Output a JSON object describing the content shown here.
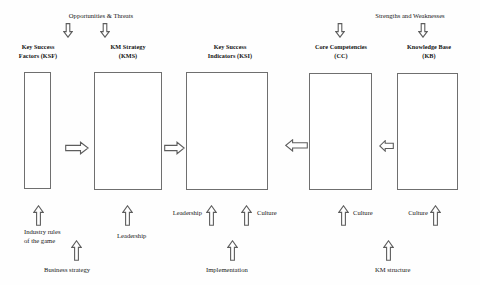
{
  "diagram": {
    "title_top_left": "Opportunities & Threats",
    "title_top_right": "Strengths and Weaknesses",
    "boxes": [
      {
        "id": "ksf",
        "line1": "Key Success",
        "line2": "Factors (KSF)"
      },
      {
        "id": "kms",
        "line1": "KM Strategy",
        "line2": "(KMS)"
      },
      {
        "id": "ksi",
        "line1": "Key Success",
        "line2": "Indicators (KSI)"
      },
      {
        "id": "cc",
        "line1": "Core Competencies",
        "line2": "(CC)"
      },
      {
        "id": "kb",
        "line1": "Knowledge Base",
        "line2": "(KB)"
      }
    ],
    "bottom_labels": {
      "industry_rules_line1": "Industry rules",
      "industry_rules_line2": "of the game",
      "business_strategy": "Business strategy",
      "leadership_kms": "Leadership",
      "leadership_ksi": "Leadership",
      "culture_ksi": "Culture",
      "implementation": "Implementation",
      "culture_cc": "Culture",
      "culture_kb_left": "Culture",
      "culture_kb_right": "Culture",
      "km_structure": "KM structure"
    },
    "icons": {
      "down": "arrow-down-outline",
      "up": "arrow-up-outline",
      "right": "arrow-right-outline",
      "left": "arrow-left-outline"
    },
    "colors": {
      "stroke": "#5d5d5d",
      "box_border": "#6f6f6f",
      "text": "#161616",
      "background": "#fefefe"
    }
  }
}
